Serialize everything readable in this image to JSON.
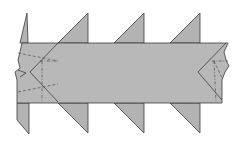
{
  "diagram": {
    "type": "origami-crease-diagram",
    "colors": {
      "paper": "#b8b8b8",
      "line": "#2e2e2e",
      "background": "#ffffff"
    },
    "labels": [
      {
        "id": "A",
        "text": "A",
        "x": 79,
        "y": 30
      },
      {
        "id": "B",
        "text": "B",
        "x": 102,
        "y": 70
      }
    ],
    "band": {
      "top": 43,
      "bottom": 103
    },
    "unit_origins_x": [
      58,
      114,
      170
    ],
    "unit_width": 56,
    "arrows": [
      {
        "name": "swing-arrow-1",
        "x": 55
      },
      {
        "name": "swing-arrow-2",
        "x": 111
      },
      {
        "name": "swing-arrow-3",
        "x": 167
      }
    ]
  }
}
